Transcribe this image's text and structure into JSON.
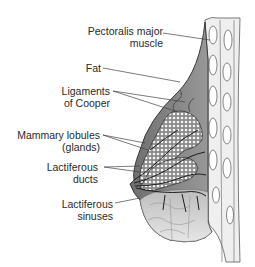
{
  "diagram": {
    "colors": {
      "outline": "#3a3a3a",
      "fat_fill": "#7d7d7d",
      "fat_fill_light": "#b8b8b8",
      "lower_tissue": "#d4d4d4",
      "lobule_fill": "#e8e8e8",
      "duct_line": "#1e1e1e",
      "chest_wall": "#f0f0f0",
      "leader_line": "#444444",
      "text": "#2a2a2a"
    },
    "labels": [
      {
        "id": "pectoralis",
        "line1": "Pectoralis major",
        "line2": "muscle"
      },
      {
        "id": "fat",
        "line1": "Fat",
        "line2": ""
      },
      {
        "id": "cooper",
        "line1": "Ligaments",
        "line2": "of Cooper"
      },
      {
        "id": "lobules",
        "line1": "Mammary lobules",
        "line2": "(glands)"
      },
      {
        "id": "ducts",
        "line1": "Lactiferous",
        "line2": "ducts"
      },
      {
        "id": "sinuses",
        "line1": "Lactiferous",
        "line2": "sinuses"
      }
    ]
  }
}
